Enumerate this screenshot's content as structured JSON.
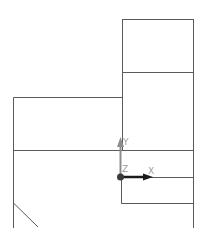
{
  "viewport": {
    "background": "#ffffff",
    "line_color": "#555555"
  },
  "axes_indicator": {
    "x_label": "X",
    "y_label": "Y",
    "z_label": "Z",
    "x_color": "#1a1a1a",
    "y_color": "#8c8c8c",
    "z_color": "#3a3a3a"
  }
}
